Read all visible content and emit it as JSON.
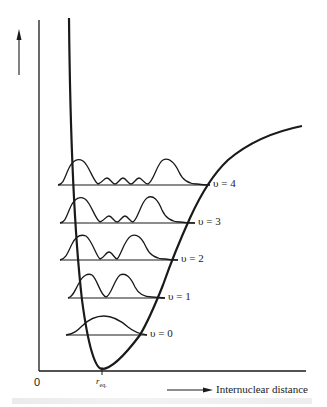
{
  "figure": {
    "y_axis_label": "Energy",
    "x_axis_label": "Internuclear distance",
    "origin_label": "0",
    "equilibrium_label": "r",
    "equilibrium_subscript": "eq.",
    "caption": "",
    "levels": [
      {
        "label": "υ = 0",
        "y": 335
      },
      {
        "label": "υ = 1",
        "y": 298
      },
      {
        "label": "υ = 2",
        "y": 260
      },
      {
        "label": "υ = 3",
        "y": 223
      },
      {
        "label": "υ = 4",
        "y": 185
      }
    ],
    "colors": {
      "ink": "#1a1a1a",
      "background": "#ffffff"
    }
  }
}
